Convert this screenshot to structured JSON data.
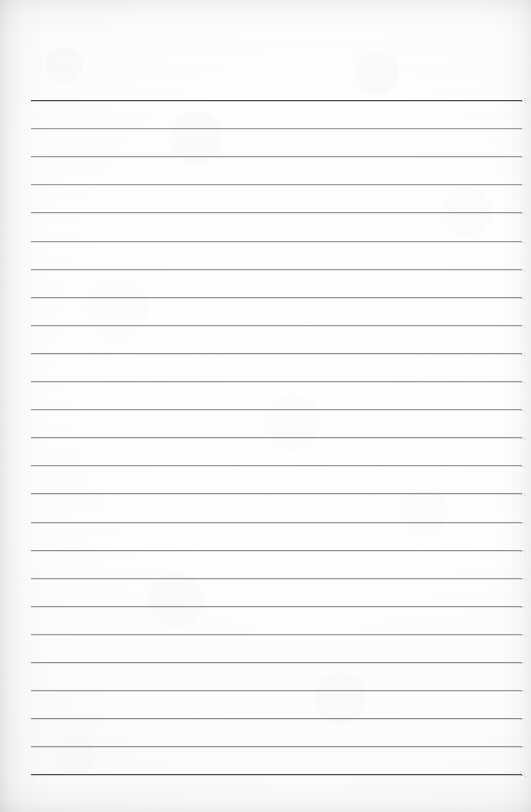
{
  "document": {
    "kind": "lined-notebook-page",
    "title": "Lined Notebook Page",
    "text_content": "",
    "page_width": 531,
    "page_height": 812,
    "paper_color": "#fdfdfd",
    "edge_shadow_color": "#78787c"
  },
  "ruling": {
    "line_count": 25,
    "first_line_y": 100,
    "line_spacing": 28.1,
    "left_margin_x": 31,
    "right_margin_x": 522,
    "line_length": 491,
    "emphasis_line_color": "#4a4a4a",
    "emphasis_line_thickness": 1.6,
    "body_line_color": "#9c9ca0",
    "body_line_thickness": 1,
    "emphasized_indices": [
      0,
      24
    ],
    "lines": [
      {
        "index": 0,
        "y": 100.0,
        "color": "#4a4a4a",
        "thickness": 1.6,
        "emphasis": true,
        "text": ""
      },
      {
        "index": 1,
        "y": 128.1,
        "color": "#a0a0a4",
        "thickness": 1,
        "emphasis": false,
        "text": ""
      },
      {
        "index": 2,
        "y": 156.2,
        "color": "#9a9a9e",
        "thickness": 1,
        "emphasis": false,
        "text": ""
      },
      {
        "index": 3,
        "y": 184.3,
        "color": "#9e9ea2",
        "thickness": 1,
        "emphasis": false,
        "text": ""
      },
      {
        "index": 4,
        "y": 212.4,
        "color": "#96969a",
        "thickness": 1,
        "emphasis": false,
        "text": ""
      },
      {
        "index": 5,
        "y": 240.5,
        "color": "#9c9ca0",
        "thickness": 1,
        "emphasis": false,
        "text": ""
      },
      {
        "index": 6,
        "y": 268.6,
        "color": "#9a9a9e",
        "thickness": 1,
        "emphasis": false,
        "text": ""
      },
      {
        "index": 7,
        "y": 296.7,
        "color": "#93939a",
        "thickness": 1,
        "emphasis": false,
        "text": ""
      },
      {
        "index": 8,
        "y": 324.8,
        "color": "#9a9a9e",
        "thickness": 1,
        "emphasis": false,
        "text": ""
      },
      {
        "index": 9,
        "y": 352.9,
        "color": "#8f8f96",
        "thickness": 1,
        "emphasis": false,
        "text": ""
      },
      {
        "index": 10,
        "y": 381.0,
        "color": "#97979c",
        "thickness": 1,
        "emphasis": false,
        "text": ""
      },
      {
        "index": 11,
        "y": 409.1,
        "color": "#9b9ba0",
        "thickness": 1,
        "emphasis": false,
        "text": ""
      },
      {
        "index": 12,
        "y": 437.2,
        "color": "#93939a",
        "thickness": 1,
        "emphasis": false,
        "text": ""
      },
      {
        "index": 13,
        "y": 465.3,
        "color": "#9a9a9e",
        "thickness": 1,
        "emphasis": false,
        "text": ""
      },
      {
        "index": 14,
        "y": 493.4,
        "color": "#8e8e95",
        "thickness": 1,
        "emphasis": false,
        "text": ""
      },
      {
        "index": 15,
        "y": 521.5,
        "color": "#98989e",
        "thickness": 1,
        "emphasis": false,
        "text": ""
      },
      {
        "index": 16,
        "y": 549.6,
        "color": "#919198",
        "thickness": 1,
        "emphasis": false,
        "text": ""
      },
      {
        "index": 17,
        "y": 577.7,
        "color": "#9a9a9e",
        "thickness": 1,
        "emphasis": false,
        "text": ""
      },
      {
        "index": 18,
        "y": 605.8,
        "color": "#93939a",
        "thickness": 1,
        "emphasis": false,
        "text": ""
      },
      {
        "index": 19,
        "y": 633.9,
        "color": "#9c9ca0",
        "thickness": 1,
        "emphasis": false,
        "text": ""
      },
      {
        "index": 20,
        "y": 662.0,
        "color": "#909097",
        "thickness": 1,
        "emphasis": false,
        "text": ""
      },
      {
        "index": 21,
        "y": 690.1,
        "color": "#98989e",
        "thickness": 1,
        "emphasis": false,
        "text": ""
      },
      {
        "index": 22,
        "y": 718.2,
        "color": "#8d8d94",
        "thickness": 1,
        "emphasis": false,
        "text": ""
      },
      {
        "index": 23,
        "y": 746.3,
        "color": "#949499",
        "thickness": 1,
        "emphasis": false,
        "text": ""
      },
      {
        "index": 24,
        "y": 774.4,
        "color": "#4e4e4e",
        "thickness": 1.5,
        "emphasis": true,
        "text": ""
      }
    ]
  }
}
